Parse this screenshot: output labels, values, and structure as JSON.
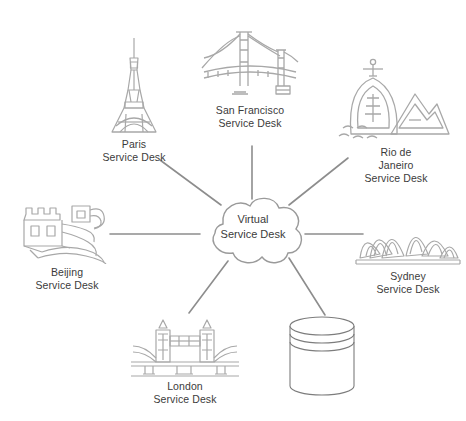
{
  "diagram": {
    "title": "Virtual Service Desk",
    "center": {
      "name": "virtual-service-desk",
      "label": "Virtual\nService Desk",
      "shape": "cloud"
    },
    "nodes": [
      {
        "id": "paris",
        "label": "Paris\nService Desk",
        "icon": "eiffel-tower-icon"
      },
      {
        "id": "sanfran",
        "label": "San Francisco\nService Desk",
        "icon": "golden-gate-bridge-icon"
      },
      {
        "id": "rio",
        "label": "Rio de\nJaneiro\nService Desk",
        "icon": "christ-the-redeemer-icon"
      },
      {
        "id": "sydney",
        "label": "Sydney\nService Desk",
        "icon": "sydney-opera-house-icon"
      },
      {
        "id": "skms",
        "label": "Service\nKnowledge\nManagement\nSystem",
        "icon": "database-cylinder-icon"
      },
      {
        "id": "london",
        "label": "London\nService Desk",
        "icon": "tower-bridge-icon"
      },
      {
        "id": "beijing",
        "label": "Beijing\nService Desk",
        "icon": "great-wall-icon"
      }
    ],
    "colors": {
      "line": "#8d8d8d",
      "icon": "#a8a8a8",
      "text": "#3b3b3b",
      "background": "#ffffff"
    }
  }
}
